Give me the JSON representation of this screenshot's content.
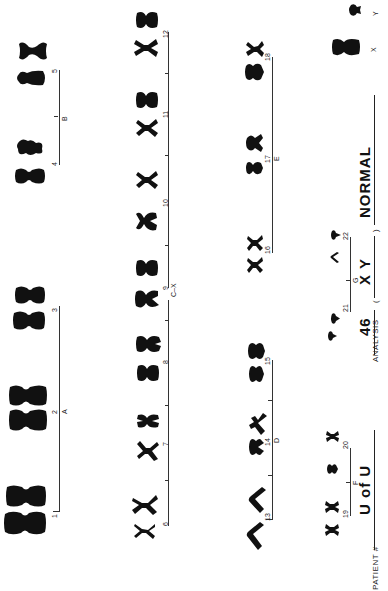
{
  "form": {
    "title": "Karyotype",
    "orientation": "rotated -90deg",
    "ink_color": "#111111",
    "paper_color": "#ffffff"
  },
  "groups": [
    {
      "name": "A",
      "chromosomes": [
        "1",
        "2",
        "3"
      ]
    },
    {
      "name": "B",
      "chromosomes": [
        "4",
        "5"
      ]
    },
    {
      "name": "C-X",
      "chromosomes": [
        "6",
        "7",
        "8",
        "9",
        "10",
        "11",
        "12"
      ]
    },
    {
      "name": "D",
      "chromosomes": [
        "13",
        "14",
        "15"
      ]
    },
    {
      "name": "E",
      "chromosomes": [
        "16",
        "17",
        "18"
      ]
    },
    {
      "name": "F",
      "chromosomes": [
        "19",
        "20"
      ]
    },
    {
      "name": "G",
      "chromosomes": [
        "21",
        "22"
      ]
    }
  ],
  "sex_chromosomes": {
    "x_label": "X",
    "y_label": "Y"
  },
  "labels": {
    "n1": "1",
    "n2": "2",
    "n3": "3",
    "n4": "4",
    "n5": "5",
    "n6": "6",
    "n7": "7",
    "n8": "8",
    "n9": "9",
    "n10": "10",
    "n11": "11",
    "n12": "12",
    "n13": "13",
    "n14": "14",
    "n15": "15",
    "n16": "16",
    "n17": "17",
    "n18": "18",
    "n19": "19",
    "n20": "20",
    "n21": "21",
    "n22": "22",
    "gA": "A",
    "gB": "B",
    "gC": "C–X",
    "gD": "D",
    "gE": "E",
    "gF": "F",
    "gG": "G",
    "x": "X",
    "y": "Y"
  },
  "patient": {
    "label": "PATIENT #",
    "value": "U of U"
  },
  "analysis": {
    "label": "ANALYSIS",
    "count": "46",
    "open_paren": "(",
    "sex": "X Y",
    "close_paren": ")",
    "result": "NORMAL"
  }
}
